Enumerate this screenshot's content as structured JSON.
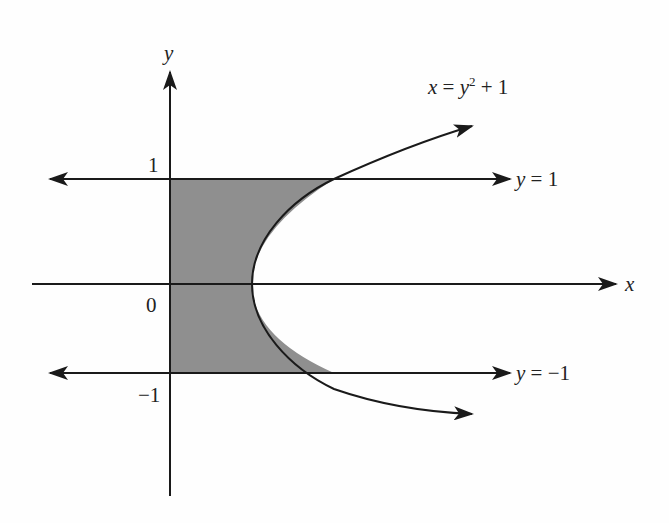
{
  "diagram": {
    "axes": {
      "x_label": "x",
      "y_label": "y"
    },
    "ticks": {
      "y_one": "1",
      "origin": "0",
      "y_neg_one": "−1"
    },
    "curves": [
      {
        "id": "parabola",
        "label": "x = y² + 1",
        "label_parts": {
          "lhs": "x",
          "eq": " = ",
          "var": "y",
          "exp": "2",
          "rest": " + 1"
        }
      },
      {
        "id": "line-top",
        "label": "y = 1",
        "label_parts": {
          "var": "y",
          "rest": " = 1"
        }
      },
      {
        "id": "line-bottom",
        "label": "y = −1",
        "label_parts": {
          "var": "y",
          "rest": " = −1"
        }
      }
    ],
    "shaded_region": "Region bounded by x = 0, y = 1, y = −1 and x = y² + 1",
    "colors": {
      "line": "#1a1a1a",
      "shade": "#8f8f8f",
      "background": "#fefefe"
    }
  }
}
